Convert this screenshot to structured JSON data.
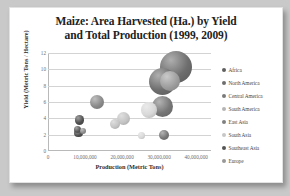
{
  "chart_data": {
    "type": "scatter",
    "title": "Maize: Area Harvested (Ha.) by Yield and Total Production (1999, 2009)",
    "title_line1": "Maize: Area Harvested (Ha.) by Yield",
    "title_line2": "and Total Production (1999, 2009)",
    "xlabel": "Production (Metric Tons)",
    "ylabel": "Yield (Metric Tons / Hectare)",
    "xlim": [
      0,
      44000000
    ],
    "ylim": [
      0,
      12
    ],
    "xticks": [
      "0",
      "10,000,000",
      "20,000,000",
      "30,000,000",
      "40,000,000"
    ],
    "xtick_values": [
      0,
      10000000,
      20000000,
      30000000,
      40000000
    ],
    "yticks": [
      "0",
      "2",
      "4",
      "6",
      "8",
      "10",
      "12"
    ],
    "ytick_values": [
      0,
      2,
      4,
      6,
      8,
      10,
      12
    ],
    "grid": true,
    "legend_position": "right",
    "bubble_size_meaning": "Area Harvested (Ha.)",
    "series": [
      {
        "name": "Africa",
        "color": "#4f4f4f",
        "points": [
          {
            "x": 8200000,
            "y": 2.2,
            "r": 4.2,
            "year": 1999
          },
          {
            "x": 8600000,
            "y": 3.8,
            "r": 4.6,
            "year": 2009
          }
        ]
      },
      {
        "name": "North America",
        "color": "#6e6e6e",
        "points": [
          {
            "x": 30800000,
            "y": 8.5,
            "r": 13.5,
            "year": 1999
          },
          {
            "x": 34500000,
            "y": 10.3,
            "r": 16.0,
            "year": 2009
          }
        ]
      },
      {
        "name": "Central America",
        "color": "#8a8a8a",
        "points": [
          {
            "x": 9500000,
            "y": 2.4,
            "r": 3.0,
            "year": 1999
          },
          {
            "x": 13200000,
            "y": 6.0,
            "r": 7.0,
            "year": 2009
          }
        ]
      },
      {
        "name": "South America",
        "color": "#c4c4c4",
        "points": [
          {
            "x": 18200000,
            "y": 3.3,
            "r": 5.0,
            "year": 1999
          },
          {
            "x": 20300000,
            "y": 4.0,
            "r": 6.5,
            "year": 2009
          }
        ]
      },
      {
        "name": "East Asia",
        "color": "#777777",
        "points": [
          {
            "x": 31000000,
            "y": 5.4,
            "r": 10.5,
            "year": 1999
          },
          {
            "x": 31200000,
            "y": 1.9,
            "r": 5.0,
            "year": 2009
          }
        ]
      },
      {
        "name": "South Asia",
        "color": "#d8d8d8",
        "points": [
          {
            "x": 25200000,
            "y": 1.9,
            "r": 3.6,
            "year": 1999
          },
          {
            "x": 27300000,
            "y": 5.0,
            "r": 7.8,
            "year": 2009
          }
        ]
      },
      {
        "name": "Southeast Asia",
        "color": "#5a5a5a",
        "points": [
          {
            "x": 8000000,
            "y": 2.6,
            "r": 3.6,
            "year": 1999
          }
        ]
      },
      {
        "name": "Europe",
        "color": "#9e9e9e",
        "points": [
          {
            "x": 33000000,
            "y": 8.6,
            "r": 10.0,
            "year": 2009
          }
        ]
      }
    ]
  },
  "legend": {
    "items": [
      {
        "label": "Africa",
        "color": "#5f5f5f"
      },
      {
        "label": "North America",
        "color": "#6e6e6e"
      },
      {
        "label": "Central America",
        "color": "#7a7a7a"
      },
      {
        "label": "South America",
        "color": "#b5b5b5"
      },
      {
        "label": "East Asia",
        "color": "#808080"
      },
      {
        "label": "South Asia",
        "color": "#c7c7c7"
      },
      {
        "label": "Southeast Asia",
        "color": "#555555"
      },
      {
        "label": "Europe",
        "color": "#989898"
      }
    ]
  }
}
